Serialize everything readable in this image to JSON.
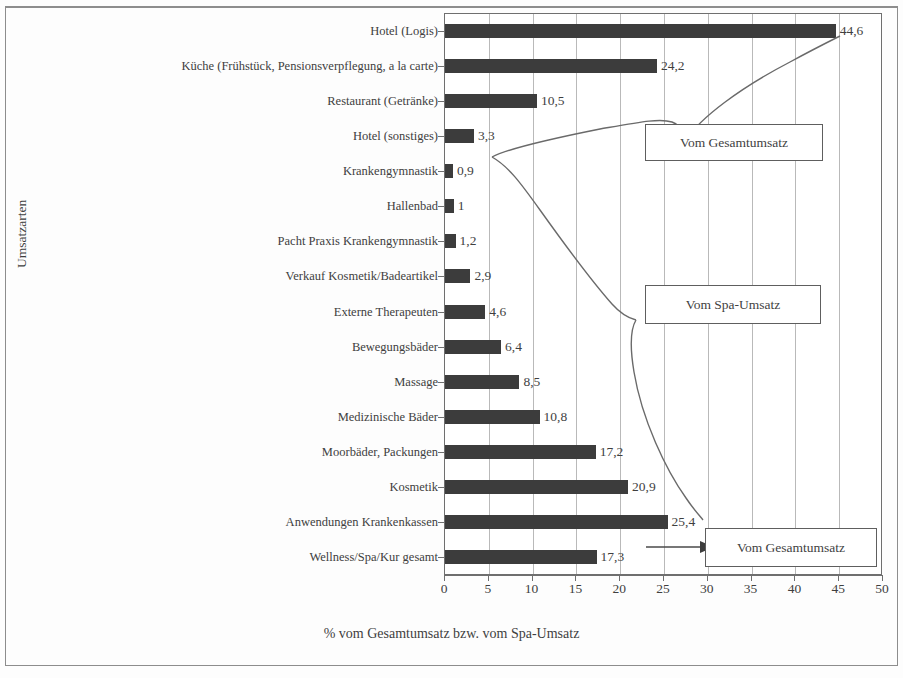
{
  "chart_data": {
    "type": "bar",
    "orientation": "horizontal",
    "title": "",
    "xlabel": "% vom Gesamtumsatz bzw. vom Spa-Umsatz",
    "ylabel": "Umsatzarten",
    "xlim": [
      0,
      50
    ],
    "xticks": [
      0,
      5,
      10,
      15,
      20,
      25,
      30,
      35,
      40,
      45,
      50
    ],
    "xtick_labels": [
      "0",
      "5",
      "10",
      "15",
      "20",
      "25",
      "30",
      "35",
      "40",
      "45",
      "50"
    ],
    "grid": true,
    "legend": null,
    "bar_color": "#3c3c3c",
    "categories": [
      "Hotel (Logis)",
      "Küche (Frühstück, Pensionsverpflegung, a la carte)",
      "Restaurant (Getränke)",
      "Hotel (sonstiges)",
      "Krankengymnastik",
      "Hallenbad",
      "Pacht Praxis Krankengymnastik",
      "Verkauf Kosmetik/Badeartikel",
      "Externe Therapeuten",
      "Bewegungsbäder",
      "Massage",
      "Medizinische Bäder",
      "Moorbäder, Packungen",
      "Kosmetik",
      "Anwendungen Krankenkassen",
      "Wellness/Spa/Kur gesamt"
    ],
    "values": [
      44.6,
      24.2,
      10.5,
      3.3,
      0.9,
      1,
      1.2,
      2.9,
      4.6,
      6.4,
      8.5,
      10.8,
      17.2,
      20.9,
      25.4,
      17.3
    ],
    "value_labels": [
      "44,6",
      "24,2",
      "10,5",
      "3,3",
      "0,9",
      "1",
      "1,2",
      "2,9",
      "4,6",
      "6,4",
      "8,5",
      "10,8",
      "17,2",
      "20,9",
      "25,4",
      "17,3"
    ],
    "annotations": [
      {
        "text": "Vom Gesamtumsatz",
        "applies_to": "Hotel (Logis) … Hotel (sonstiges)"
      },
      {
        "text": "Vom Spa-Umsatz",
        "applies_to": "Krankengymnastik … Anwendungen Krankenkassen"
      },
      {
        "text": "Vom Gesamtumsatz",
        "applies_to": "Wellness/Spa/Kur gesamt"
      }
    ]
  },
  "callouts": {
    "top": "Vom Gesamtumsatz",
    "middle": "Vom Spa-Umsatz",
    "bottom": "Vom Gesamtumsatz"
  }
}
